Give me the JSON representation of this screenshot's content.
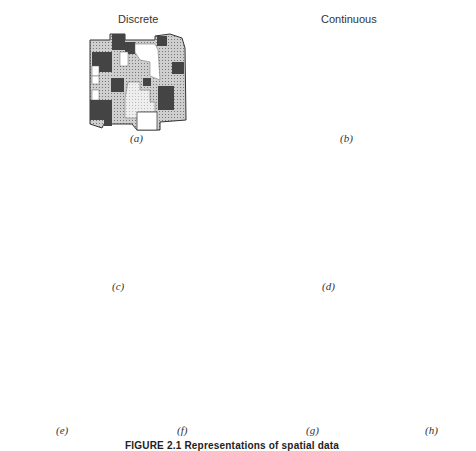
{
  "headings": {
    "discrete": "Discrete",
    "continuous": "Continuous"
  },
  "panels": [
    {
      "id": "a",
      "label": "(a)",
      "description": "Discrete choropleth map with shaded regions"
    },
    {
      "id": "b",
      "label": "(b)",
      "description": "Continuous isoline / contour map"
    },
    {
      "id": "c",
      "label": "(c)",
      "description": "Discrete 3D prism map"
    },
    {
      "id": "d",
      "label": "(d)",
      "description": "Continuous 3D surface mesh"
    },
    {
      "id": "e",
      "label": "(e)",
      "description": "Point pattern in rectangle"
    },
    {
      "id": "f",
      "label": "(f)",
      "description": "Point values as vertical spikes on a plane"
    },
    {
      "id": "g",
      "label": "(g)",
      "description": "Network of nodes and links"
    },
    {
      "id": "h",
      "label": "(h)",
      "description": "Flow vectors from a point"
    }
  ],
  "caption": "FIGURE 2.1  Representations of spatial data",
  "point_pattern": [
    [
      25,
      32
    ],
    [
      36,
      28
    ],
    [
      101,
      30
    ],
    [
      34,
      44
    ],
    [
      71,
      41
    ],
    [
      85,
      62
    ],
    [
      26,
      80
    ],
    [
      59,
      76
    ],
    [
      40,
      99
    ],
    [
      75,
      95
    ],
    [
      104,
      98
    ],
    [
      45,
      118
    ],
    [
      80,
      117
    ]
  ],
  "network": {
    "nodes": [
      [
        268,
        313
      ],
      [
        314,
        327
      ],
      [
        307,
        342
      ],
      [
        283,
        354
      ],
      [
        336,
        362
      ],
      [
        304,
        396
      ],
      [
        328,
        410
      ],
      [
        294,
        418
      ]
    ],
    "edges": [
      [
        0,
        2
      ],
      [
        1,
        2
      ],
      [
        1,
        4
      ],
      [
        2,
        3
      ],
      [
        2,
        4
      ],
      [
        3,
        4
      ],
      [
        3,
        5
      ],
      [
        4,
        5
      ],
      [
        5,
        6
      ],
      [
        5,
        7
      ]
    ]
  }
}
